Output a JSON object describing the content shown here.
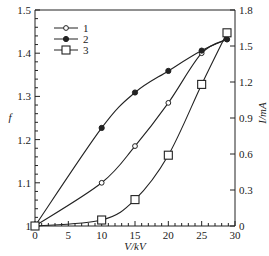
{
  "chart_data": {
    "type": "line",
    "title": "",
    "xlabel": "V/kV",
    "ylabel": "f",
    "y2label": "I/mA",
    "xlim": [
      0,
      30
    ],
    "ylim": [
      1.0,
      1.5
    ],
    "y2lim": [
      0,
      1.8
    ],
    "xticks": [
      0,
      5,
      10,
      15,
      20,
      25,
      30
    ],
    "yticks": [
      "1",
      "1.1",
      "1.2",
      "1.3",
      "1.4",
      "1.5"
    ],
    "y2ticks": [
      "0",
      "0.3",
      "0.6",
      "0.9",
      "1.2",
      "1.5",
      "1.8"
    ],
    "grid": false,
    "legend_position": "upper left",
    "series": [
      {
        "name": "1",
        "marker": "open-circle",
        "axis": "left",
        "x": [
          0,
          10,
          15,
          20,
          25,
          28.8
        ],
        "values": [
          1.0,
          1.1,
          1.185,
          1.285,
          1.4,
          1.432
        ]
      },
      {
        "name": "2",
        "marker": "filled-circle",
        "axis": "left",
        "x": [
          0,
          10,
          15,
          20,
          25,
          28.8
        ],
        "values": [
          1.0,
          1.227,
          1.309,
          1.359,
          1.406,
          1.432
        ]
      },
      {
        "name": "3",
        "marker": "open-square",
        "axis": "right",
        "x": [
          0,
          10,
          15,
          20,
          25,
          28.8
        ],
        "values": [
          0,
          0.05,
          0.22,
          0.59,
          1.18,
          1.61
        ]
      }
    ]
  },
  "legend": {
    "items": [
      {
        "label": "1"
      },
      {
        "label": "2"
      },
      {
        "label": "3"
      }
    ]
  }
}
